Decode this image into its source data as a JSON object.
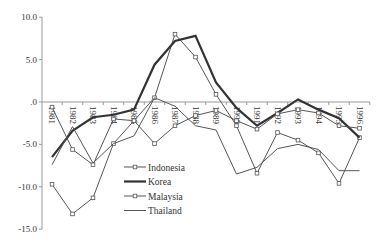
{
  "chart_data": {
    "type": "line",
    "title": "",
    "xlabel": "",
    "ylabel": "",
    "ylim": [
      -15,
      10
    ],
    "yticks": [
      10,
      5,
      0,
      -5,
      -10,
      -15
    ],
    "ytick_labels": [
      "10.0",
      "5.0",
      ".0",
      "-5.0",
      "-10.0",
      "-15.0"
    ],
    "grid": false,
    "legend_position": "inside-lower-middle",
    "categories": [
      "1981",
      "1982",
      "1983",
      "1984",
      "1985",
      "1986",
      "1987",
      "1988",
      "1989",
      "1990",
      "1991",
      "1992",
      "1993",
      "1994",
      "1995",
      "1996"
    ],
    "series": [
      {
        "name": "Indonesia",
        "style": "thin-marker",
        "values": [
          -0.6,
          -5.6,
          -7.4,
          -2.0,
          -2.2,
          0.5,
          8.0,
          5.3,
          0.9,
          -2.8,
          -8.4,
          -3.6,
          -4.5,
          -6.0,
          -9.6,
          -4.2
        ]
      },
      {
        "name": "Korea",
        "style": "thick",
        "values": [
          -6.5,
          -3.4,
          -1.8,
          -1.5,
          -0.9,
          4.4,
          7.2,
          7.8,
          2.3,
          -0.7,
          -2.8,
          -1.3,
          0.3,
          -0.9,
          -1.9,
          -4.2
        ]
      },
      {
        "name": "Malaysia",
        "style": "thin-marker",
        "values": [
          -9.7,
          -13.2,
          -11.3,
          -4.9,
          -2.2,
          -4.9,
          -2.8,
          -1.6,
          -1.0,
          -2.2,
          -3.2,
          -1.4,
          -0.9,
          -1.3,
          -2.8,
          -3.1
        ]
      },
      {
        "name": "Thailand",
        "style": "thin",
        "values": [
          -7.4,
          -2.9,
          -7.2,
          -4.9,
          -4.0,
          0.5,
          -0.5,
          -2.8,
          -3.3,
          -8.5,
          -7.7,
          -5.5,
          -5.0,
          -5.6,
          -8.1,
          -8.1
        ]
      }
    ]
  },
  "legend": {
    "items": [
      "Indonesia",
      "Korea",
      "Malaysia",
      "Thailand"
    ]
  }
}
